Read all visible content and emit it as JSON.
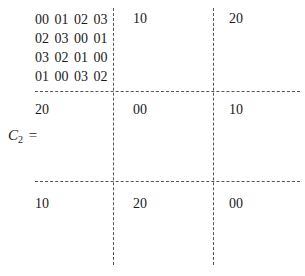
{
  "label": {
    "symbol": "C",
    "subscript": "2",
    "equals": "="
  },
  "matrix": {
    "rows": [
      [
        {
          "type": "block",
          "rows": [
            "00 01 02 03",
            "02 03 00 01",
            "03 02 01 00",
            "01 00 03 02"
          ]
        },
        {
          "type": "value",
          "text": "10"
        },
        {
          "type": "value",
          "text": "20"
        }
      ],
      [
        {
          "type": "value",
          "text": "20"
        },
        {
          "type": "value",
          "text": "00"
        },
        {
          "type": "value",
          "text": "10"
        }
      ],
      [
        {
          "type": "value",
          "text": "10"
        },
        {
          "type": "value",
          "text": "20"
        },
        {
          "type": "value",
          "text": "00"
        }
      ]
    ]
  }
}
